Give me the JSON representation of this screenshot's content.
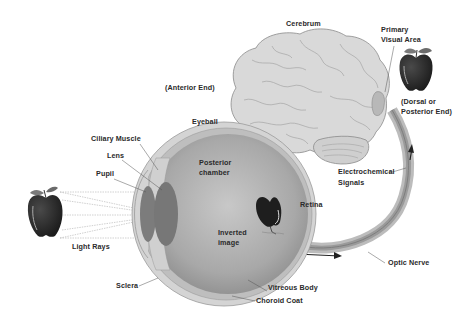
{
  "diagram": {
    "type": "anatomy",
    "labels": {
      "cerebrum": "Cerebrum",
      "primary_visual_area_1": "Primary",
      "primary_visual_area_2": "Visual Area",
      "dorsal_1": "(Dorsal or",
      "dorsal_2": "Posterior End)",
      "anterior_end": "(Anterior End)",
      "eyeball": "Eyeball",
      "ciliary_muscle": "Ciliary Muscle",
      "lens": "Lens",
      "pupil": "Pupil",
      "posterior_chamber_1": "Posterior",
      "posterior_chamber_2": "chamber",
      "retina": "Retina",
      "inverted_image_1": "Inverted",
      "inverted_image_2": "image",
      "electrochemical_1": "Electrochemical",
      "electrochemical_2": "Signals",
      "light_rays": "Light Rays",
      "sclera": "Sclera",
      "vitreous_body": "Vitreous Body",
      "choroid_coat": "Choroid Coat",
      "optic_nerve": "Optic Nerve"
    },
    "colors": {
      "background": "#ffffff",
      "brain_fill": "#d9d9d9",
      "brain_outline": "#8a8a8a",
      "eye_outer": "#cfcfcf",
      "eye_inner": "#a9a9a9",
      "lens": "#7a7a7a",
      "apple": "#2b2b2b",
      "visual_area": "#b5b5b5",
      "text": "#2a2a2a"
    }
  }
}
